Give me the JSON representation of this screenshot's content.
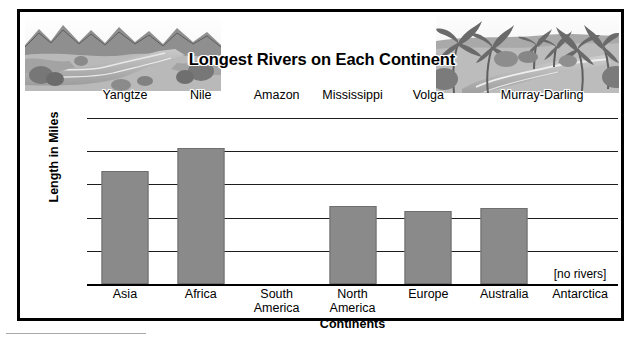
{
  "chart_data": {
    "type": "bar",
    "title": "Longest Rivers on Each Continent",
    "xlabel": "Continents",
    "ylabel": "Length in Miles",
    "categories": [
      "Asia",
      "Africa",
      "South\nAmerica",
      "North\nAmerica",
      "Europe",
      "Australia",
      "Antarctica"
    ],
    "series_labels": [
      "Yangtze",
      "Nile",
      "Amazon",
      "Mississippi",
      "Volga",
      "Murray-Darling"
    ],
    "values": [
      3400,
      4100,
      0,
      2340,
      2190,
      2300,
      0
    ],
    "yticks": [
      "0",
      "1,000",
      "2,000",
      "3,000",
      "4,000",
      "5,000"
    ],
    "ytick_values": [
      0,
      1000,
      2000,
      3000,
      4000,
      5000
    ],
    "ylim": [
      0,
      5000
    ],
    "grid": true,
    "legend": "none",
    "bar_color": "#8a8a8a",
    "annotations": [
      {
        "category": "Antarctica",
        "text": "[no rivers]"
      }
    ]
  },
  "chart": {
    "title": "Longest Rivers on Each Continent",
    "x_axis_title": "Continents",
    "y_axis_title": "Length in Miles",
    "no_rivers_note": "[no rivers]",
    "rivers": [
      {
        "name": "Yangtze"
      },
      {
        "name": "Nile"
      },
      {
        "name": "Amazon"
      },
      {
        "name": "Mississippi"
      },
      {
        "name": "Volga"
      },
      {
        "name": "Murray-Darling"
      }
    ],
    "continents": [
      {
        "label": "Asia",
        "value": 3400
      },
      {
        "label": "Africa",
        "value": 4100
      },
      {
        "label": "South\nAmerica",
        "value": 0
      },
      {
        "label": "North\nAmerica",
        "value": 2340
      },
      {
        "label": "Europe",
        "value": 2190
      },
      {
        "label": "Australia",
        "value": 2300
      },
      {
        "label": "Antarctica",
        "value": 0
      }
    ],
    "y_ticks": [
      {
        "label": "5,000"
      },
      {
        "label": "4,000"
      },
      {
        "label": "3,000"
      },
      {
        "label": "2,000"
      },
      {
        "label": "1,000"
      },
      {
        "label": "0"
      }
    ]
  }
}
